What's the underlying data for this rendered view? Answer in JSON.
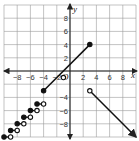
{
  "chart_data": {
    "type": "line",
    "title": "",
    "xlabel": "x",
    "ylabel": "y",
    "xlim": [
      -10,
      10
    ],
    "ylim": [
      -10,
      10
    ],
    "grid": true,
    "grid_step": 2,
    "x_ticks": [
      "−8",
      "−6",
      "−4",
      "−2",
      "2",
      "4",
      "6",
      "8"
    ],
    "x_tick_values": [
      -8,
      -6,
      -4,
      -2,
      2,
      4,
      6,
      8
    ],
    "y_ticks": [
      "8",
      "6",
      "4",
      "2",
      "−4",
      "−6",
      "−8"
    ],
    "y_tick_values": [
      8,
      6,
      4,
      2,
      -4,
      -6,
      -8
    ],
    "origin_label": "O",
    "series": [
      {
        "name": "segment",
        "points": [
          [
            -4,
            -3
          ],
          [
            3,
            4
          ]
        ],
        "start": "closed",
        "end": "closed"
      },
      {
        "name": "ray",
        "points": [
          [
            3,
            -3
          ],
          [
            10,
            -10
          ]
        ],
        "start": "open",
        "end": "arrow"
      },
      {
        "name": "isolated-point",
        "points": [
          [
            -1,
            -1
          ]
        ],
        "start": "open"
      },
      {
        "name": "steps",
        "steps": [
          {
            "from": [
              -5,
              -5
            ],
            "to": [
              -4,
              -5
            ]
          },
          {
            "from": [
              -6,
              -6
            ],
            "to": [
              -5,
              -6
            ]
          },
          {
            "from": [
              -7,
              -7
            ],
            "to": [
              -6,
              -7
            ]
          },
          {
            "from": [
              -8,
              -8
            ],
            "to": [
              -7,
              -8
            ]
          },
          {
            "from": [
              -9,
              -9
            ],
            "to": [
              -8,
              -9
            ]
          },
          {
            "from": [
              -10,
              -10
            ],
            "to": [
              -9,
              -10
            ]
          }
        ],
        "start": "closed",
        "end": "open"
      }
    ]
  }
}
